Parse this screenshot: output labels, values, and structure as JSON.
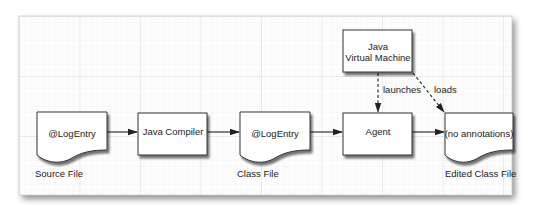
{
  "diagram": {
    "colors": {
      "background": "#ffffff",
      "panel": "#fdfdfd",
      "grid_minor": "#ececec",
      "grid_major": "#d6d6d6",
      "shape_fill": "#ffffff",
      "stroke": "#333333",
      "text": "#222222"
    },
    "nodes": [
      {
        "id": "source-file",
        "shape": "document",
        "text": "@LogEntry",
        "caption": "Source File"
      },
      {
        "id": "java-compiler",
        "shape": "box",
        "text": "Java Compiler"
      },
      {
        "id": "class-file",
        "shape": "document",
        "text": "@LogEntry",
        "caption": "Class File"
      },
      {
        "id": "agent",
        "shape": "box",
        "text": "Agent"
      },
      {
        "id": "jvm",
        "shape": "box",
        "text_line1": "Java",
        "text_line2": "Virtual Machine"
      },
      {
        "id": "edited-class-file",
        "shape": "document",
        "text": "(no annotations)",
        "caption": "Edited Class File"
      }
    ],
    "edges": [
      {
        "from": "source-file",
        "to": "java-compiler",
        "style": "solid",
        "label": ""
      },
      {
        "from": "java-compiler",
        "to": "class-file",
        "style": "solid",
        "label": ""
      },
      {
        "from": "class-file",
        "to": "agent",
        "style": "solid",
        "label": ""
      },
      {
        "from": "agent",
        "to": "edited-class-file",
        "style": "solid",
        "label": ""
      },
      {
        "from": "jvm",
        "to": "agent",
        "style": "dashed",
        "label": "launches"
      },
      {
        "from": "jvm",
        "to": "edited-class-file",
        "style": "dashed",
        "label": "loads"
      }
    ]
  }
}
